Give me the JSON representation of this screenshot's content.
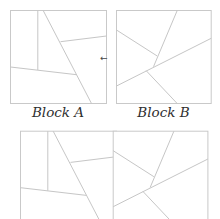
{
  "diagram": {
    "colors": {
      "line": "#c6c6c6",
      "text": "#2e2e2e",
      "background": "#ffffff"
    },
    "blocks": [
      {
        "id": "A",
        "label": "Block A",
        "box": {
          "x": 10,
          "y": 10.5,
          "w": 96,
          "h": 93
        },
        "segments": [
          [
            37.3,
            10.5,
            37.3,
            70
          ],
          [
            42.7,
            10.5,
            91,
            103.5
          ],
          [
            60,
            41.7,
            106,
            36
          ],
          [
            10,
            67,
            76,
            74.7
          ]
        ]
      },
      {
        "id": "B",
        "label": "Block B",
        "box": {
          "x": 116,
          "y": 10.5,
          "w": 94.7,
          "h": 93
        },
        "segments": [
          [
            176.7,
            10.5,
            153,
            66.7
          ],
          [
            116,
            30,
            156.7,
            56
          ],
          [
            116,
            86,
            210.7,
            38.3
          ],
          [
            145.7,
            70.7,
            176.7,
            103.5
          ]
        ]
      }
    ],
    "arrow": {
      "glyph": "←",
      "x": 100,
      "y": 61
    },
    "combined": {
      "offset_y": 120.7,
      "parts": [
        {
          "block": "A",
          "offset_x": 10
        },
        {
          "block": "B",
          "offset_x": -3.3
        }
      ]
    }
  }
}
